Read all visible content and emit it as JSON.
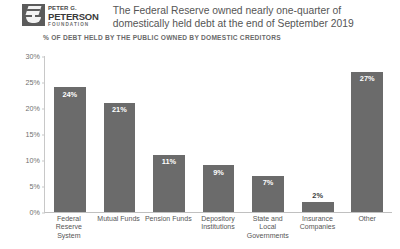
{
  "brand": {
    "logo_icon": "peterson-foundation-torch-icon",
    "line1": "PETER G.",
    "line2": "PETERSON",
    "line3": "FOUNDATION"
  },
  "header": {
    "title": "The Federal Reserve owned nearly one-quarter of domestically held debt at the end of September 2019"
  },
  "colors": {
    "bar": "#6b6b6b",
    "text": "#555555",
    "axis": "#c8c8c8",
    "background": "#ffffff",
    "label_inside": "#ffffff",
    "label_outside": "#3c3c3c"
  },
  "chart_data": {
    "type": "bar",
    "title": "% OF DEBT HELD BY THE PUBLIC OWNED BY DOMESTIC CREDITORS",
    "xlabel": "",
    "ylabel": "",
    "ylim": [
      0,
      30
    ],
    "grid": false,
    "legend": false,
    "ytick_labels": [
      "30%",
      "25%",
      "20%",
      "15%",
      "10%",
      "5%",
      "0%"
    ],
    "ytick_values": [
      30,
      25,
      20,
      15,
      10,
      5,
      0
    ],
    "categories": [
      "Federal Reserve System",
      "Mutual Funds",
      "Pension Funds",
      "Depository Institutions",
      "State and Local Governments",
      "Insurance Companies",
      "Other"
    ],
    "values": [
      24,
      21,
      11,
      9,
      7,
      2,
      27
    ],
    "value_labels": [
      "24%",
      "21%",
      "11%",
      "9%",
      "7%",
      "2%",
      "27%"
    ],
    "label_placement": [
      "inside",
      "inside",
      "inside",
      "inside",
      "inside",
      "outside",
      "inside"
    ]
  }
}
